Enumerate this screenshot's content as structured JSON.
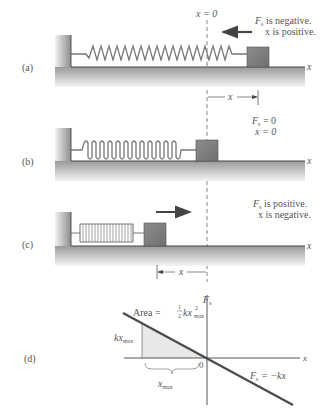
{
  "figure": {
    "panels": [
      {
        "id": "a",
        "label": "(a)",
        "origin_label": "x = 0",
        "annotation_line1": "F",
        "annotation_sub1": "s",
        "annotation_rest1": " is negative.",
        "annotation_line2": "x is positive.",
        "axis_label": "x",
        "displacement_label": "x"
      },
      {
        "id": "b",
        "label": "(b)",
        "annotation_line1": "F",
        "annotation_sub1": "s",
        "annotation_rest1": " = 0",
        "annotation_line2": "x = 0",
        "axis_label": "x"
      },
      {
        "id": "c",
        "label": "(c)",
        "annotation_line1": "F",
        "annotation_sub1": "s",
        "annotation_rest1": " is positive.",
        "annotation_line2": "x is negative.",
        "axis_label": "x",
        "displacement_label": "x"
      },
      {
        "id": "d",
        "label": "(d)",
        "y_axis_label": "F",
        "y_axis_sub": "s",
        "x_axis_label": "x",
        "origin": "0",
        "area_label": "Area = ",
        "area_frac_num": "1",
        "area_frac_den": "2",
        "area_kx": "kx",
        "area_sup": "2",
        "area_sub": "max",
        "kxmax_label": "kx",
        "kxmax_sub": "max",
        "xmax_label": "x",
        "xmax_sub": "max",
        "line_label_F": "F",
        "line_label_sub": "s",
        "line_label_rest": " = −kx"
      }
    ]
  },
  "colors": {
    "wall": "#8a8a8a",
    "block": "#7d7d7d",
    "arrow": "#555555",
    "line": "#4a4a4a",
    "shade": "#e6e6e6",
    "text": "#555555"
  }
}
